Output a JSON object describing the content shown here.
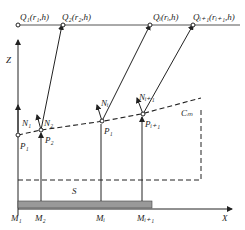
{
  "diagram": {
    "axes": {
      "z_label": "Z",
      "x_label": "X"
    },
    "top_points": [
      {
        "name": "Q1",
        "label": "Q₁(r₁,h)"
      },
      {
        "name": "Q2",
        "label": "Q₂(r₂,h)"
      },
      {
        "name": "Qi",
        "label": "Qᵢ(rᵢ,h)"
      },
      {
        "name": "Qi+1",
        "label": "Qᵢ₊₁(rᵢ₊₁,h)"
      }
    ],
    "normals": [
      {
        "name": "N1",
        "label": "N₁"
      },
      {
        "name": "N2",
        "label": "N₂"
      },
      {
        "name": "Ni",
        "label": "Nᵢ"
      },
      {
        "name": "Ni+1",
        "label": "Nᵢ₊₁"
      }
    ],
    "surface_points": [
      {
        "name": "P1-left",
        "label": "P₁"
      },
      {
        "name": "P2",
        "label": "P₂"
      },
      {
        "name": "Pi",
        "label": "P₁"
      },
      {
        "name": "Pi+1",
        "label": "Pᵢ₊₁"
      }
    ],
    "curve_label": "Cₘ",
    "region_label": "S",
    "base_points": [
      {
        "name": "M1",
        "label": "M₁"
      },
      {
        "name": "M2",
        "label": "M₂"
      },
      {
        "name": "Mi",
        "label": "Mᵢ"
      },
      {
        "name": "Mi+1",
        "label": "Mᵢ₊₁"
      }
    ]
  }
}
